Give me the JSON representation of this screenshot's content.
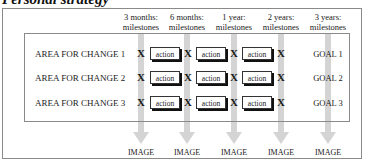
{
  "title": "Personal strategy",
  "columns": [
    {
      "label_line1": "3 months:",
      "label_line2": "milestones",
      "center": 141
    },
    {
      "label_line1": "6 months:",
      "label_line2": "milestones",
      "center": 187
    },
    {
      "label_line1": "1 year:",
      "label_line2": "milestones",
      "center": 234
    },
    {
      "label_line1": "2 years:",
      "label_line2": "milestones",
      "center": 281
    },
    {
      "label_line1": "3 years:",
      "label_line2": "milestones",
      "center": 328
    }
  ],
  "rows": [
    {
      "label": "AREA FOR  CHANGE 1",
      "marker": "X",
      "action": "action",
      "goal": "GOAL 1"
    },
    {
      "label": "AREA FOR CHANGE 2",
      "marker": "X",
      "action": "action",
      "goal": "GOAL 2"
    },
    {
      "label": "AREA FOR CHANGE 3",
      "marker": "X",
      "action": "action",
      "goal": "GOAL 3"
    }
  ],
  "outputs": [
    "IMAGE",
    "IMAGE",
    "IMAGE",
    "IMAGE",
    "IMAGE"
  ],
  "colors": {
    "stripe": "#d4d4d4",
    "border": "#8a8a8a",
    "text": "#1a1a1a"
  }
}
